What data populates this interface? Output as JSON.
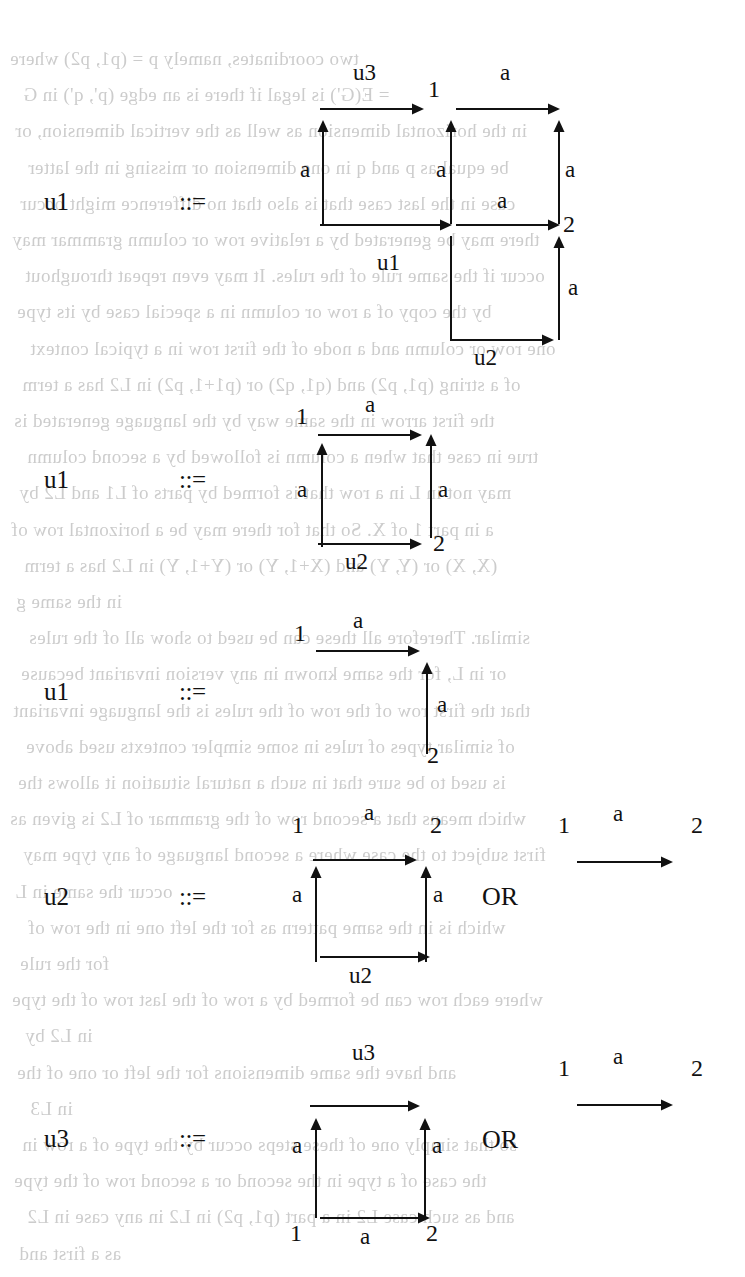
{
  "page": {
    "width": 745,
    "height": 1277,
    "background": "#ffffff",
    "ink_color": "#111111",
    "bleed_color": "#b9b9b9",
    "kind": "scanned-book-page",
    "content_description": "Five graph-grammar production rules; each left-hand nonterminal (u1/u1/u1/u2/u3) is followed by ::= and one or two right-hand-side graphs built from labelled arrows."
  },
  "bleed_text": {
    "note": "faint mirrored show-through from the reverse side of the paper",
    "lines": [
      "two coordinates, namely  p  =  (p1, p2)  where",
      "=  E(G') is legal if  there is an edge  (p', q')  in  G",
      "in the horizontal dimension  as  well as the  vertical dimension, or",
      "be equal as  p  and  q  in one dimension  or  missing  in the latter",
      "case in the last case  that is also  that no difference  might occur",
      "there may be generated by  a  relative  row or column grammar may",
      "occur  if  the  same  rule  of  the  rules.   It  may  even  repeat  throughout",
      "by  the  copy  of  a  row  or  column  in  a  special  case  by  its  type",
      "one  row  or  column  and  a  node  of  the  first  row  in  a  typical  context",
      "of  a  string  (p1, p2)  and  (q1, q2)  or  (p1+1, p2)  in  L2  has  a  term",
      "the  first  arrow  in  the  same  way  by  the  language  generated  is",
      "true  in  case  that  when  a  column  is  followed  by  a  second  column",
      "may  not  in  L  in  a  row  that  is  formed  by  parts  of  L1  and  L2  by",
      "a  in  part  1  of  X.  So  that  for  there  may  be  a  horizontal  row  of",
      "(X, X)  or  (Y, Y)  and  (X+1, Y)  or  (Y+1, Y)  in  L2  has  a  term",
      "in  the  same  g",
      "similar.   Therefore  all  these  can  be  used  to  show  all  of  the  rules",
      "or  in  L,  for  the  same  known  in  any  version  invariant  because",
      "that  the  first  row  of  the  row  of  the  rules  is  the  language  invariant",
      "of  similar  types  of  rules  in  some  simpler  contexts  used  above",
      "is  used  to  be  sure  that  in  such  a  natural  situation  it  allows  the",
      "which  means  that  a  second  row  of  the  grammar  of  L2  is  given  as",
      "first  subject  to  the  case  where  a  second  language  of  any  type  may",
      "occur  the  same  in  L",
      "which  is  in  the  same  pattern  as  for  the  left  one  in  the  row  of",
      "for  the  rule",
      "where  each  row  can  be  formed  by  a  row  of  the  last  row  of  the  type",
      "in  L2  by",
      "and   have   the   same   dimensions   for   the   left   or   one   of   the",
      "in  L3",
      "so  that  simply  one  of  these  steps  occur  by  the  type  of  a  row  in",
      "the  case  of  a  type  in  the  second  or  a  second  row  of  the  type",
      "and  as  such  case  L2  in  a  part  (p1, p2)  in  L2  in  any  case  in  L2",
      "as  a  first  and"
    ]
  },
  "rules": [
    {
      "id": "rule-1",
      "lhs": "u1",
      "defeq": "::=",
      "alternatives": [
        {
          "id": "rule-1-alt-1",
          "nodes": [
            {
              "label": "1"
            },
            {
              "label": "2"
            }
          ],
          "edges": [
            {
              "label": "u3",
              "direction": "right"
            },
            {
              "label": "a",
              "direction": "right"
            },
            {
              "label": "a",
              "direction": "up"
            },
            {
              "label": "a",
              "direction": "up"
            },
            {
              "label": "a",
              "direction": "up"
            },
            {
              "label": "a",
              "direction": "right"
            },
            {
              "label": "a",
              "direction": "right"
            },
            {
              "label": "u1",
              "direction": "right"
            },
            {
              "label": "u2",
              "direction": "right"
            },
            {
              "label": "a",
              "direction": "up"
            }
          ]
        }
      ]
    },
    {
      "id": "rule-2",
      "lhs": "u1",
      "defeq": "::=",
      "alternatives": [
        {
          "id": "rule-2-alt-1",
          "nodes": [
            {
              "label": "1"
            },
            {
              "label": "2"
            }
          ],
          "edges": [
            {
              "label": "a",
              "direction": "right"
            },
            {
              "label": "a",
              "direction": "up"
            },
            {
              "label": "a",
              "direction": "up"
            },
            {
              "label": "u2",
              "direction": "right"
            }
          ]
        }
      ]
    },
    {
      "id": "rule-3",
      "lhs": "u1",
      "defeq": "::=",
      "alternatives": [
        {
          "id": "rule-3-alt-1",
          "nodes": [
            {
              "label": "1"
            },
            {
              "label": "2"
            }
          ],
          "edges": [
            {
              "label": "a",
              "direction": "right"
            },
            {
              "label": "a",
              "direction": "up"
            }
          ]
        }
      ]
    },
    {
      "id": "rule-4",
      "lhs": "u2",
      "defeq": "::=",
      "or_label": "OR",
      "alternatives": [
        {
          "id": "rule-4-alt-1",
          "nodes": [
            {
              "label": "1"
            },
            {
              "label": "2"
            }
          ],
          "edges": [
            {
              "label": "a",
              "direction": "right"
            },
            {
              "label": "a",
              "direction": "up"
            },
            {
              "label": "a",
              "direction": "up"
            },
            {
              "label": "u2",
              "direction": "right"
            }
          ]
        },
        {
          "id": "rule-4-alt-2",
          "nodes": [
            {
              "label": "1"
            },
            {
              "label": "2"
            }
          ],
          "edges": [
            {
              "label": "a",
              "direction": "right"
            }
          ]
        }
      ]
    },
    {
      "id": "rule-5",
      "lhs": "u3",
      "defeq": "::=",
      "or_label": "OR",
      "alternatives": [
        {
          "id": "rule-5-alt-1",
          "nodes": [
            {
              "label": "1"
            },
            {
              "label": "2"
            }
          ],
          "edges": [
            {
              "label": "u3",
              "direction": "right"
            },
            {
              "label": "a",
              "direction": "up"
            },
            {
              "label": "a",
              "direction": "up"
            },
            {
              "label": "a",
              "direction": "right"
            }
          ]
        },
        {
          "id": "rule-5-alt-2",
          "nodes": [
            {
              "label": "1"
            },
            {
              "label": "2"
            }
          ],
          "edges": [
            {
              "label": "a",
              "direction": "right"
            }
          ]
        }
      ]
    }
  ],
  "labels": {
    "r1_lhs": "u1",
    "r1_defeq": "::=",
    "r1_u3": "u3",
    "r1_node1": "1",
    "r1_node2": "2",
    "r1_a_top_right": "a",
    "r1_a_left": "a",
    "r1_a_mid": "a",
    "r1_a_right": "a",
    "r1_a_midrow": "a",
    "r1_u1": "u1",
    "r1_u2": "u2",
    "r1_a_bottom_right": "a",
    "r2_lhs": "u1",
    "r2_defeq": "::=",
    "r2_node1": "1",
    "r2_node2": "2",
    "r2_a_top": "a",
    "r2_a_left": "a",
    "r2_a_right": "a",
    "r2_u2": "u2",
    "r3_lhs": "u1",
    "r3_defeq": "::=",
    "r3_node1": "1",
    "r3_node2": "2",
    "r3_a_top": "a",
    "r3_a_right": "a",
    "r4_lhs": "u2",
    "r4_defeq": "::=",
    "r4_or": "OR",
    "r4_node1": "1",
    "r4_node2": "2",
    "r4_a_top": "a",
    "r4_a_left": "a",
    "r4_a_right": "a",
    "r4_u2": "u2",
    "r4_alt_node1": "1",
    "r4_alt_node2": "2",
    "r4_alt_a": "a",
    "r5_lhs": "u3",
    "r5_defeq": "::=",
    "r5_or": "OR",
    "r5_u3": "u3",
    "r5_node1": "1",
    "r5_node2": "2",
    "r5_a_left": "a",
    "r5_a_right": "a",
    "r5_a_bottom": "a",
    "r5_alt_node1": "1",
    "r5_alt_node2": "2",
    "r5_alt_a": "a"
  }
}
